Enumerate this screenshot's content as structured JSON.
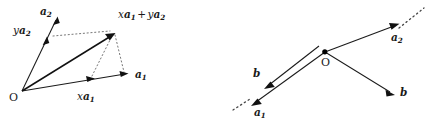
{
  "figure": {
    "background_color": "#ffffff",
    "ink_color": "#1a1a1a",
    "dotted_color": "#777777",
    "width": 427,
    "height": 121,
    "panels": [
      {
        "id": "left-panel",
        "name": "linear-combination-diagram",
        "origin_label": "O",
        "labels": [
          {
            "id": "a2",
            "text": "a2",
            "scalar": "",
            "base": "a",
            "subscript": "2"
          },
          {
            "id": "ya2",
            "text": "ya2",
            "scalar": "y",
            "base": "a",
            "subscript": "2"
          },
          {
            "id": "xa1-plus-ya2",
            "scalar1": "x",
            "base1": "a",
            "sub1": "1",
            "operator": "+",
            "scalar2": "y",
            "base2": "a",
            "sub2": "2"
          },
          {
            "id": "a1",
            "text": "a1",
            "scalar": "",
            "base": "a",
            "subscript": "1"
          },
          {
            "id": "xa1",
            "text": "xa1",
            "scalar": "x",
            "base": "a",
            "subscript": "1"
          }
        ]
      },
      {
        "id": "right-panel",
        "name": "collinear-vectors-diagram",
        "origin_label": "O",
        "labels": [
          {
            "id": "a2r",
            "text": "a2",
            "scalar": "",
            "base": "a",
            "subscript": "2"
          },
          {
            "id": "a1r",
            "text": "a1",
            "scalar": "",
            "base": "a",
            "subscript": "1"
          },
          {
            "id": "b-left",
            "text": "b",
            "base": "b",
            "subscript": ""
          },
          {
            "id": "b-right",
            "text": "b",
            "base": "b",
            "subscript": ""
          }
        ]
      }
    ]
  },
  "left": {
    "origin": "O",
    "a2_scalar": "",
    "a2_base": "a",
    "a2_sub": "2",
    "ya2_scalar": "y",
    "ya2_base": "a",
    "ya2_sub": "2",
    "result_scalar1": "x",
    "result_base1": "a",
    "result_sub1": "1",
    "result_op": "+",
    "result_scalar2": "y",
    "result_base2": "a",
    "result_sub2": "2",
    "a1_base": "a",
    "a1_sub": "1",
    "xa1_scalar": "x",
    "xa1_base": "a",
    "xa1_sub": "1"
  },
  "right": {
    "origin": "O",
    "a2_base": "a",
    "a2_sub": "2",
    "a1_base": "a",
    "a1_sub": "1",
    "b_left": "b",
    "b_right": "b"
  }
}
